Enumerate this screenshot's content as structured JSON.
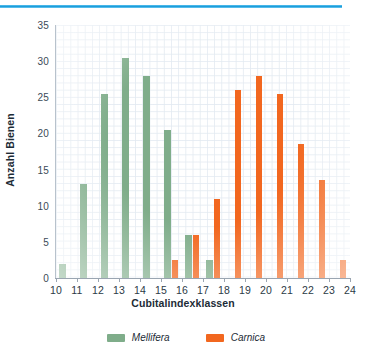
{
  "decor": {
    "top_rule_color": "#1e9ddb"
  },
  "colors": {
    "mellifera": "#7fad8a",
    "carnica": "#f2671f"
  },
  "legend": {
    "items": [
      {
        "label": "Mellifera",
        "swatch": "mellifera",
        "icon": "legend-swatch-icon"
      },
      {
        "label": "Carnica",
        "swatch": "carnica",
        "icon": "legend-swatch-icon"
      }
    ]
  },
  "axes": {
    "y_title": "Anzahl Bienen",
    "x_title": "Cubitalindexklassen",
    "y_ticks": [
      "0",
      "5",
      "10",
      "15",
      "20",
      "25",
      "30",
      "35"
    ],
    "x_ticks": [
      "10",
      "11",
      "12",
      "13",
      "14",
      "15",
      "16",
      "17",
      "18",
      "19",
      "20",
      "21",
      "22",
      "23",
      "24"
    ]
  },
  "chart_data": {
    "type": "bar",
    "title": "",
    "xlabel": "Cubitalindexklassen",
    "ylabel": "Anzahl Bienen",
    "categories": [
      "10",
      "11",
      "12",
      "13",
      "14",
      "15",
      "16",
      "17",
      "18",
      "19",
      "20",
      "21",
      "22",
      "23"
    ],
    "series": [
      {
        "name": "Mellifera",
        "color": "#7fad8a",
        "values": [
          2,
          13,
          25.5,
          30.5,
          28,
          20.5,
          6,
          2.5,
          0,
          0,
          0,
          0,
          0,
          0
        ]
      },
      {
        "name": "Carnica",
        "color": "#f2671f",
        "values": [
          0,
          0,
          0,
          0,
          0,
          2.5,
          6,
          11,
          26,
          28,
          25.5,
          18.5,
          13.5,
          2.5
        ]
      }
    ],
    "ylim": [
      0,
      35
    ],
    "ytick_values": [
      0,
      5,
      10,
      15,
      20,
      25,
      30,
      35
    ],
    "xlim": [
      10,
      24
    ],
    "grid": true,
    "legend_position": "bottom"
  }
}
